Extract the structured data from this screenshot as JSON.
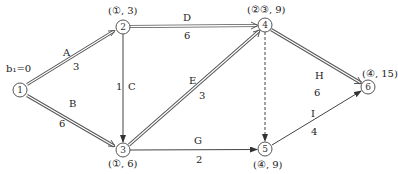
{
  "diagram": {
    "type": "network-critical-path",
    "start_label": "b₁=0",
    "nodes": [
      {
        "id": "1",
        "label": "1",
        "x": 20,
        "y": 90,
        "mark": ""
      },
      {
        "id": "2",
        "label": "2",
        "x": 123,
        "y": 27,
        "mark": "(①, 3)"
      },
      {
        "id": "3",
        "label": "3",
        "x": 123,
        "y": 150,
        "mark": "(①, 6)"
      },
      {
        "id": "4",
        "label": "4",
        "x": 265,
        "y": 25,
        "mark": "(②③, 9)"
      },
      {
        "id": "5",
        "label": "5",
        "x": 265,
        "y": 149,
        "mark": "(④, 9)"
      },
      {
        "id": "6",
        "label": "6",
        "x": 368,
        "y": 87,
        "mark": "(④, 15)"
      }
    ],
    "edges": [
      {
        "id": "A",
        "from": "1",
        "to": "2",
        "name": "A",
        "weight": "3",
        "style": "double"
      },
      {
        "id": "B",
        "from": "1",
        "to": "3",
        "name": "B",
        "weight": "6",
        "style": "double"
      },
      {
        "id": "C",
        "from": "2",
        "to": "3",
        "name": "C",
        "weight": "1",
        "style": "single"
      },
      {
        "id": "D",
        "from": "2",
        "to": "4",
        "name": "D",
        "weight": "6",
        "style": "double"
      },
      {
        "id": "E",
        "from": "3",
        "to": "4",
        "name": "E",
        "weight": "3",
        "style": "double"
      },
      {
        "id": "G",
        "from": "3",
        "to": "5",
        "name": "G",
        "weight": "2",
        "style": "single"
      },
      {
        "id": "dummy",
        "from": "4",
        "to": "5",
        "name": "",
        "weight": "",
        "style": "dashed"
      },
      {
        "id": "H",
        "from": "4",
        "to": "6",
        "name": "H",
        "weight": "6",
        "style": "double"
      },
      {
        "id": "I",
        "from": "5",
        "to": "6",
        "name": "I",
        "weight": "4",
        "style": "single"
      }
    ]
  },
  "labels": {
    "start": "b₁=0",
    "n2_mark": "(①, 3)",
    "n3_mark": "(①, 6)",
    "n4_mark": "(②③, 9)",
    "n5_mark": "(④, 9)",
    "n6_mark": "(④, 15)",
    "A_name": "A",
    "A_w": "3",
    "B_name": "B",
    "B_w": "6",
    "C_name": "C",
    "C_w": "1",
    "D_name": "D",
    "D_w": "6",
    "E_name": "E",
    "E_w": "3",
    "G_name": "G",
    "G_w": "2",
    "H_name": "H",
    "H_w": "6",
    "I_name": "I",
    "I_w": "4",
    "n1": "1",
    "n2": "2",
    "n3": "3",
    "n4": "4",
    "n5": "5",
    "n6": "6"
  }
}
